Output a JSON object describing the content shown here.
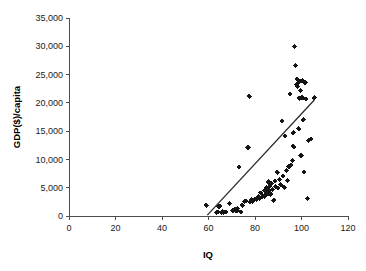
{
  "chart_data": {
    "type": "scatter",
    "title": "",
    "xlabel": "IQ",
    "ylabel": "GDP($)/capita",
    "xlim": [
      0,
      120
    ],
    "ylim": [
      0,
      35000
    ],
    "xticks": [
      0,
      20,
      40,
      60,
      80,
      100,
      120
    ],
    "xtick_labels": [
      "0",
      "20",
      "40",
      "60",
      "80",
      "100",
      "120"
    ],
    "yticks": [
      0,
      5000,
      10000,
      15000,
      20000,
      25000,
      30000,
      35000
    ],
    "ytick_labels": [
      "0",
      "5,000",
      "10,000",
      "15,000",
      "20,000",
      "25,000",
      "30,000",
      "35,000"
    ],
    "grid": false,
    "legend": false,
    "legend_position": "none",
    "marker_color": "#151515",
    "marker_shape": "diamond",
    "axis_color": "#4d4d4d",
    "trend_line": {
      "label": "trend",
      "color": "#2b2b2b",
      "x_start": 59.5,
      "y_start": 150,
      "x_end": 105.5,
      "y_end": 20500
    },
    "series": [
      {
        "name": "Countries",
        "points": [
          [
            59.0,
            1900
          ],
          [
            63.5,
            600
          ],
          [
            64.0,
            700
          ],
          [
            64.5,
            1700
          ],
          [
            64.8,
            1750
          ],
          [
            65.5,
            650
          ],
          [
            66.0,
            800
          ],
          [
            66.5,
            700
          ],
          [
            67.5,
            750
          ],
          [
            69.0,
            2200
          ],
          [
            70.5,
            950
          ],
          [
            71.0,
            1050
          ],
          [
            71.5,
            1200
          ],
          [
            71.8,
            900
          ],
          [
            72.0,
            1100
          ],
          [
            72.3,
            1000
          ],
          [
            72.5,
            1350
          ],
          [
            73.0,
            8650
          ],
          [
            74.0,
            700
          ],
          [
            74.5,
            1900
          ],
          [
            75.5,
            2550
          ],
          [
            76.0,
            2650
          ],
          [
            77.0,
            12100
          ],
          [
            77.5,
            21150
          ],
          [
            78.0,
            2500
          ],
          [
            78.5,
            2900
          ],
          [
            79.0,
            2600
          ],
          [
            80.0,
            3050
          ],
          [
            80.5,
            2950
          ],
          [
            81.0,
            3150
          ],
          [
            81.5,
            3400
          ],
          [
            82.0,
            3050
          ],
          [
            82.5,
            4100
          ],
          [
            83.0,
            3300
          ],
          [
            83.5,
            3550
          ],
          [
            84.0,
            3450
          ],
          [
            84.2,
            4550
          ],
          [
            84.5,
            3700
          ],
          [
            84.8,
            4400
          ],
          [
            85.0,
            5000
          ],
          [
            85.2,
            4750
          ],
          [
            85.5,
            3900
          ],
          [
            85.8,
            6000
          ],
          [
            86.0,
            4200
          ],
          [
            86.3,
            4500
          ],
          [
            86.5,
            5300
          ],
          [
            86.8,
            3850
          ],
          [
            87.0,
            5700
          ],
          [
            87.5,
            4650
          ],
          [
            88.0,
            2800
          ],
          [
            88.5,
            6200
          ],
          [
            89.0,
            5200
          ],
          [
            89.5,
            7700
          ],
          [
            90.0,
            4950
          ],
          [
            90.5,
            6500
          ],
          [
            91.0,
            5500
          ],
          [
            91.5,
            16800
          ],
          [
            92.0,
            7100
          ],
          [
            92.5,
            5050
          ],
          [
            93.0,
            14150
          ],
          [
            93.5,
            8000
          ],
          [
            94.0,
            6300
          ],
          [
            94.5,
            8700
          ],
          [
            95.0,
            21600
          ],
          [
            95.5,
            9000
          ],
          [
            96.0,
            9800
          ],
          [
            96.3,
            12400
          ],
          [
            96.5,
            14700
          ],
          [
            96.8,
            12200
          ],
          [
            97.0,
            29900
          ],
          [
            97.5,
            26600
          ],
          [
            97.8,
            23200
          ],
          [
            98.0,
            24200
          ],
          [
            98.3,
            22900
          ],
          [
            98.5,
            23500
          ],
          [
            98.8,
            15400
          ],
          [
            99.0,
            20800
          ],
          [
            99.3,
            23800
          ],
          [
            99.5,
            22200
          ],
          [
            99.8,
            10700
          ],
          [
            100.0,
            21000
          ],
          [
            100.3,
            23900
          ],
          [
            100.5,
            20900
          ],
          [
            100.8,
            17000
          ],
          [
            101.0,
            7800
          ],
          [
            101.5,
            23600
          ],
          [
            102.0,
            20700
          ],
          [
            102.5,
            3100
          ],
          [
            103.0,
            13300
          ],
          [
            104.0,
            13600
          ],
          [
            105.5,
            20900
          ]
        ]
      }
    ]
  },
  "geometry": {
    "plot_left_px": 69,
    "plot_right_px": 348,
    "plot_bottom_px": 216,
    "plot_top_px": 18
  }
}
